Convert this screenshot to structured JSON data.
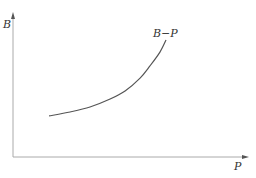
{
  "chart_data": {
    "type": "line",
    "title": "",
    "xlabel": "P",
    "ylabel": "B",
    "xlim": [
      0,
      10
    ],
    "ylim": [
      0,
      10
    ],
    "grid": false,
    "ticks": false,
    "series": [
      {
        "name": "B-P",
        "label": "B−P",
        "x": [
          1.54,
          2.44,
          3.29,
          4.15,
          4.79,
          5.43,
          5.85,
          6.28,
          6.54
        ],
        "y": [
          2.89,
          3.17,
          3.52,
          4.08,
          4.65,
          5.56,
          6.41,
          7.39,
          8.24
        ]
      }
    ],
    "colors": {
      "axis": "#aaaaaa",
      "curve": "#555555",
      "text": "#333333"
    }
  }
}
